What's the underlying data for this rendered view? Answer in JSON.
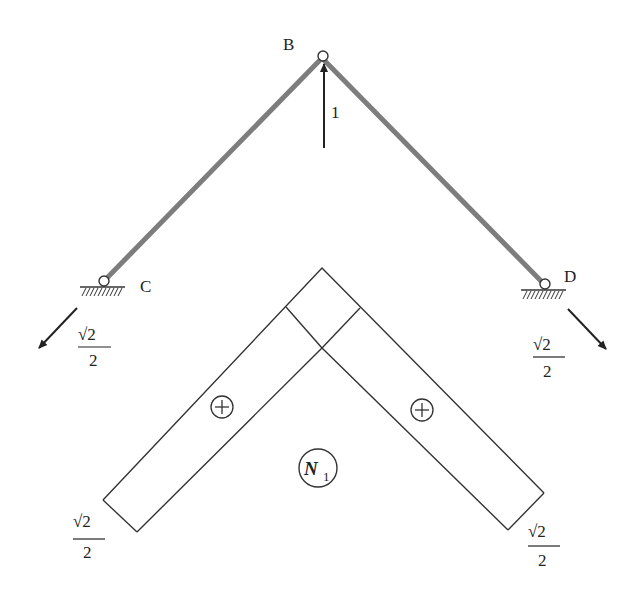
{
  "diagram": {
    "colors": {
      "member": "#7a7a7a",
      "line": "#333333",
      "text": "#222222"
    },
    "nodes": [
      {
        "id": "B",
        "label": "B"
      },
      {
        "id": "C",
        "label": "C"
      },
      {
        "id": "D",
        "label": "D"
      }
    ],
    "load": {
      "label": "1",
      "direction": "up",
      "node": "B"
    },
    "reactions": [
      {
        "node": "C",
        "num": "√2",
        "den": "2",
        "direction": "down-left"
      },
      {
        "node": "D",
        "num": "√2",
        "den": "2",
        "direction": "down-right"
      }
    ],
    "force_diagram": {
      "label_main": "N",
      "label_sub": "1",
      "signs": [
        "+",
        "+"
      ],
      "end_values": [
        {
          "side": "left",
          "num": "√2",
          "den": "2"
        },
        {
          "side": "right",
          "num": "√2",
          "den": "2"
        }
      ]
    }
  }
}
